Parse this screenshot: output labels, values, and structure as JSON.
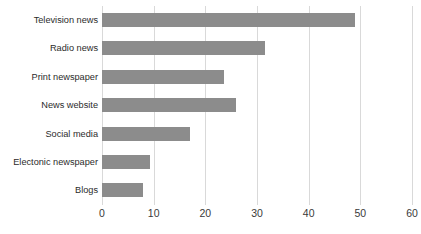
{
  "chart_data": {
    "type": "bar",
    "orientation": "horizontal",
    "title": "",
    "subtitle": "",
    "xlabel": "",
    "ylabel": "",
    "categories": [
      "Television news",
      "Radio news",
      "Print newspaper",
      "News website",
      "Social media",
      "Electonic newspaper",
      "Blogs"
    ],
    "values": [
      49,
      31.5,
      23.6,
      26,
      17,
      9.3,
      8
    ],
    "series": [
      {
        "name": "",
        "values": [
          49,
          31.5,
          23.6,
          26,
          17,
          9.3,
          8
        ]
      }
    ],
    "xlim": [
      0,
      60
    ],
    "xticks": [
      0,
      10,
      20,
      30,
      40,
      50,
      60
    ],
    "xtick_labels": [
      "0",
      "10",
      "20",
      "30",
      "40",
      "50",
      "60"
    ],
    "grid": "vertical",
    "legend": "none",
    "bar_color": "#8c8c8c",
    "gridline_color": "#d9d9d9",
    "label_color": "#2b2b2b",
    "background": "#ffffff"
  }
}
